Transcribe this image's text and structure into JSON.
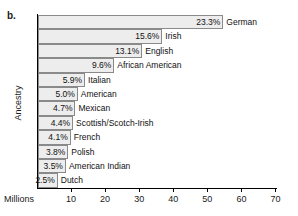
{
  "panel": {
    "label": "b."
  },
  "axes": {
    "y_title": "Ancestry",
    "x_title": "Millions",
    "x_ticks": [
      10,
      20,
      30,
      40,
      50,
      60,
      70
    ]
  },
  "chart_data": {
    "type": "bar",
    "orientation": "horizontal",
    "title": "",
    "xlabel": "Millions",
    "ylabel": "Ancestry",
    "xlim": [
      0,
      70
    ],
    "grid": false,
    "legend": null,
    "categories": [
      "German",
      "Irish",
      "English",
      "African American",
      "Italian",
      "American",
      "Mexican",
      "Scottish/Scotch-Irish",
      "French",
      "Polish",
      "American Indian",
      "Dutch"
    ],
    "percent_labels": [
      "23.3%",
      "15.6%",
      "13.1%",
      "9.6%",
      "5.9%",
      "5.0%",
      "4.7%",
      "4.4%",
      "4.1%",
      "3.8%",
      "3.5%",
      "2.5%"
    ],
    "percents": [
      23.3,
      15.6,
      13.1,
      9.6,
      5.9,
      5.0,
      4.7,
      4.4,
      4.1,
      3.8,
      3.5,
      2.5
    ],
    "values": [
      54.4,
      36.5,
      30.6,
      22.4,
      13.8,
      11.7,
      11.0,
      10.3,
      9.6,
      8.9,
      8.2,
      5.8
    ]
  },
  "style": {
    "bar_fill": "#ededed",
    "bar_border": "#8a8a8a",
    "axis_color": "#000000"
  }
}
